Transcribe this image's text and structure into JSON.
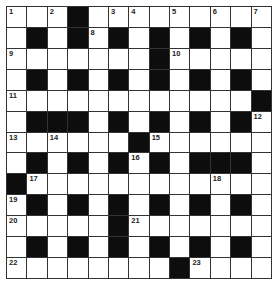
{
  "puzzle": {
    "rows": 13,
    "cols": 13,
    "layout": [
      "...#.........",
      ".#.#.#.#.#.#.",
      ".......#.....",
      ".#.#.#.#.#.#.",
      "............#",
      ".###.#.#.#.#.",
      "......#......",
      ".#.#.#.#.###.",
      "#............",
      ".#.#.#.#.#.#.",
      ".....#.......",
      ".#.#.#.#.#.#.",
      "........#...."
    ],
    "numbers": [
      {
        "r": 0,
        "c": 0,
        "n": "1"
      },
      {
        "r": 0,
        "c": 2,
        "n": "2"
      },
      {
        "r": 0,
        "c": 5,
        "n": "3"
      },
      {
        "r": 0,
        "c": 6,
        "n": "4"
      },
      {
        "r": 0,
        "c": 8,
        "n": "5"
      },
      {
        "r": 0,
        "c": 10,
        "n": "6"
      },
      {
        "r": 0,
        "c": 12,
        "n": "7"
      },
      {
        "r": 1,
        "c": 4,
        "n": "8"
      },
      {
        "r": 2,
        "c": 0,
        "n": "9"
      },
      {
        "r": 2,
        "c": 8,
        "n": "10"
      },
      {
        "r": 4,
        "c": 0,
        "n": "11"
      },
      {
        "r": 5,
        "c": 12,
        "n": "12"
      },
      {
        "r": 6,
        "c": 0,
        "n": "13"
      },
      {
        "r": 6,
        "c": 2,
        "n": "14"
      },
      {
        "r": 6,
        "c": 7,
        "n": "15"
      },
      {
        "r": 7,
        "c": 6,
        "n": "16"
      },
      {
        "r": 8,
        "c": 1,
        "n": "17"
      },
      {
        "r": 8,
        "c": 10,
        "n": "18"
      },
      {
        "r": 9,
        "c": 0,
        "n": "19"
      },
      {
        "r": 10,
        "c": 0,
        "n": "20"
      },
      {
        "r": 10,
        "c": 6,
        "n": "21"
      },
      {
        "r": 12,
        "c": 0,
        "n": "22"
      },
      {
        "r": 12,
        "c": 9,
        "n": "23"
      }
    ]
  }
}
